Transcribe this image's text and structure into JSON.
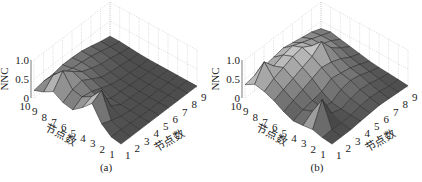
{
  "chart_data": [
    {
      "type": "surface3d",
      "panel_label": "(a)",
      "zlabel": "NNC",
      "xlabel": "节点数",
      "ylabel": "节点数",
      "x_ticks": [
        "1",
        "2",
        "3",
        "4",
        "5",
        "6",
        "7",
        "8",
        "9"
      ],
      "y_ticks": [
        "1",
        "2",
        "3",
        "4",
        "5",
        "6",
        "7",
        "8",
        "9",
        "10"
      ],
      "z_ticks": [
        "0",
        "0.5",
        "1.0"
      ],
      "zlim": [
        0,
        1.0
      ],
      "grid": true,
      "colormap": "gray",
      "z": [
        [
          0.05,
          0.05,
          0.05,
          0.05,
          0.05,
          0.05,
          0.05,
          0.05,
          0.05
        ],
        [
          0.1,
          0.1,
          0.08,
          0.06,
          0.05,
          0.05,
          0.05,
          0.05,
          0.05
        ],
        [
          0.3,
          0.2,
          0.12,
          0.08,
          0.06,
          0.05,
          0.05,
          0.05,
          0.05
        ],
        [
          0.7,
          0.85,
          0.25,
          0.1,
          0.08,
          0.06,
          0.05,
          0.05,
          0.05
        ],
        [
          0.45,
          0.55,
          0.3,
          0.12,
          0.1,
          0.08,
          0.06,
          0.05,
          0.05
        ],
        [
          0.25,
          0.4,
          0.35,
          0.25,
          0.15,
          0.1,
          0.08,
          0.06,
          0.05
        ],
        [
          0.3,
          0.45,
          0.5,
          0.35,
          0.2,
          0.15,
          0.12,
          0.08,
          0.06
        ],
        [
          0.45,
          0.8,
          0.6,
          0.4,
          0.3,
          0.22,
          0.18,
          0.12,
          0.08
        ],
        [
          0.3,
          0.55,
          0.4,
          0.35,
          0.32,
          0.28,
          0.22,
          0.15,
          0.1
        ],
        [
          0.2,
          0.25,
          0.25,
          0.3,
          0.3,
          0.28,
          0.22,
          0.15,
          0.1
        ]
      ]
    },
    {
      "type": "surface3d",
      "panel_label": "(b)",
      "zlabel": "NNC",
      "xlabel": "节点数",
      "ylabel": "节点数",
      "x_ticks": [
        "1",
        "2",
        "3",
        "4",
        "5",
        "6",
        "7",
        "8",
        "9"
      ],
      "y_ticks": [
        "1",
        "2",
        "3",
        "4",
        "5",
        "6",
        "7",
        "8",
        "9",
        "10"
      ],
      "z_ticks": [
        "0",
        "0.5",
        "1.0"
      ],
      "zlim": [
        0,
        1.0
      ],
      "grid": true,
      "colormap": "gray",
      "z": [
        [
          0.05,
          0.05,
          0.05,
          0.08,
          0.1,
          0.12,
          0.1,
          0.08,
          0.06
        ],
        [
          0.08,
          0.1,
          0.08,
          0.1,
          0.15,
          0.18,
          0.15,
          0.1,
          0.08
        ],
        [
          0.15,
          0.75,
          0.2,
          0.12,
          0.2,
          0.25,
          0.22,
          0.15,
          0.1
        ],
        [
          0.12,
          0.3,
          0.2,
          0.15,
          0.3,
          0.35,
          0.3,
          0.2,
          0.12
        ],
        [
          0.1,
          0.2,
          0.25,
          0.3,
          0.45,
          0.4,
          0.35,
          0.25,
          0.15
        ],
        [
          0.2,
          0.3,
          0.4,
          0.5,
          0.6,
          0.55,
          0.45,
          0.3,
          0.2
        ],
        [
          0.35,
          0.45,
          0.55,
          0.65,
          0.75,
          0.95,
          0.6,
          0.4,
          0.25
        ],
        [
          0.45,
          0.6,
          0.7,
          0.8,
          0.85,
          0.7,
          0.55,
          0.45,
          0.3
        ],
        [
          0.5,
          0.9,
          0.6,
          0.7,
          0.75,
          0.65,
          0.55,
          0.45,
          0.35
        ],
        [
          0.35,
          0.4,
          0.45,
          0.5,
          0.55,
          0.5,
          0.45,
          0.4,
          0.3
        ]
      ]
    }
  ],
  "panels": [
    {
      "caption": "(a)",
      "zlabel": "NNC",
      "left_axis_title": "节点数",
      "right_axis_title": "节点数"
    },
    {
      "caption": "(b)",
      "zlabel": "NNC",
      "left_axis_title": "节点数",
      "right_axis_title": "节点数"
    }
  ]
}
